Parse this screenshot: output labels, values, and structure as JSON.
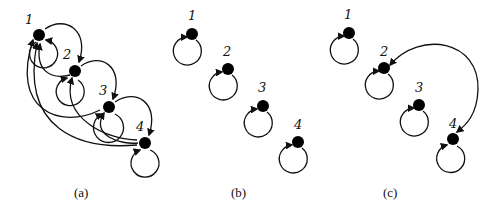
{
  "figure": {
    "panels": [
      {
        "id": "a",
        "caption": "(a)",
        "nodes": [
          {
            "id": "1",
            "label": "1"
          },
          {
            "id": "2",
            "label": "2"
          },
          {
            "id": "3",
            "label": "3"
          },
          {
            "id": "4",
            "label": "4"
          }
        ],
        "edges": [
          {
            "from": "1",
            "to": "1",
            "type": "self-loop"
          },
          {
            "from": "2",
            "to": "2",
            "type": "self-loop"
          },
          {
            "from": "3",
            "to": "3",
            "type": "self-loop"
          },
          {
            "from": "4",
            "to": "4",
            "type": "self-loop"
          },
          {
            "from": "1",
            "to": "2"
          },
          {
            "from": "2",
            "to": "3"
          },
          {
            "from": "3",
            "to": "4"
          },
          {
            "from": "2",
            "to": "1"
          },
          {
            "from": "3",
            "to": "1"
          },
          {
            "from": "4",
            "to": "1"
          },
          {
            "from": "3",
            "to": "2"
          },
          {
            "from": "4",
            "to": "2"
          },
          {
            "from": "4",
            "to": "3"
          }
        ]
      },
      {
        "id": "b",
        "caption": "(b)",
        "nodes": [
          {
            "id": "1",
            "label": "1"
          },
          {
            "id": "2",
            "label": "2"
          },
          {
            "id": "3",
            "label": "3"
          },
          {
            "id": "4",
            "label": "4"
          }
        ],
        "edges": [
          {
            "from": "1",
            "to": "1",
            "type": "self-loop"
          },
          {
            "from": "2",
            "to": "2",
            "type": "self-loop"
          },
          {
            "from": "3",
            "to": "3",
            "type": "self-loop"
          },
          {
            "from": "4",
            "to": "4",
            "type": "self-loop"
          }
        ]
      },
      {
        "id": "c",
        "caption": "(c)",
        "nodes": [
          {
            "id": "1",
            "label": "1"
          },
          {
            "id": "2",
            "label": "2"
          },
          {
            "id": "3",
            "label": "3"
          },
          {
            "id": "4",
            "label": "4"
          }
        ],
        "edges": [
          {
            "from": "1",
            "to": "1",
            "type": "self-loop"
          },
          {
            "from": "2",
            "to": "2",
            "type": "self-loop"
          },
          {
            "from": "3",
            "to": "3",
            "type": "self-loop"
          },
          {
            "from": "4",
            "to": "4",
            "type": "self-loop"
          },
          {
            "from": "4",
            "to": "2"
          },
          {
            "from": "2",
            "to": "4"
          }
        ]
      }
    ]
  }
}
